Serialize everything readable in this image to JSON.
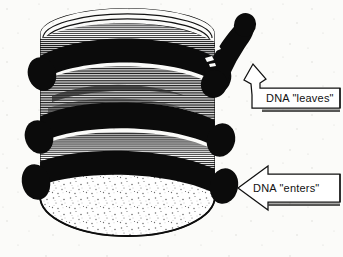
{
  "figure": {
    "kind": "scanned-line-art-diagram",
    "background_color": "#fbfbf9",
    "ink_color": "#111111",
    "paper_speckle": true
  },
  "callouts": [
    {
      "id": "dna-leaves",
      "label": "DNA \"leaves\"",
      "arrow_style": "bent-block-arrow",
      "arrow_direction": "up-left",
      "box": {
        "x": 258,
        "y": 88,
        "width": 82,
        "height": 20
      }
    },
    {
      "id": "dna-enters",
      "label": "DNA \"enters\"",
      "arrow_style": "block-arrow",
      "arrow_direction": "left",
      "box": {
        "x": 250,
        "y": 178,
        "width": 90,
        "height": 20
      }
    }
  ],
  "structure": {
    "cylinder": {
      "left": 40,
      "right": 215,
      "top": 30,
      "bottom": 232
    },
    "top_cap_arcs": 6,
    "black_helical_bands": 3,
    "hatched_coil_bands": 3,
    "bottom_face": "stippled ellipse",
    "tube_tail_top_right": true
  }
}
